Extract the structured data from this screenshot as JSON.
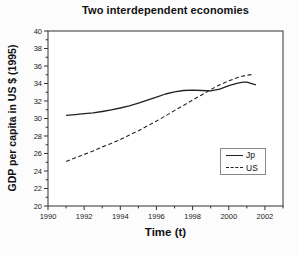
{
  "chart_data": {
    "type": "line",
    "title": "Two interdependent economies",
    "xlabel": "Time (t)",
    "ylabel": "GDP per capita in US $ (1995)",
    "xlim": [
      1990,
      2003
    ],
    "ylim": [
      20,
      40
    ],
    "xticks": [
      1990,
      1992,
      1994,
      1996,
      1998,
      2000,
      2002
    ],
    "yticks": [
      20,
      22,
      24,
      26,
      28,
      30,
      32,
      34,
      36,
      38,
      40
    ],
    "x_minor_step": 1,
    "y_minor_step": 1,
    "grid": false,
    "legend_position": "right-middle",
    "axis_color": "#333333",
    "series": [
      {
        "name": "Jp",
        "style": "solid",
        "color": "#222222",
        "points": [
          [
            1991,
            30.35
          ],
          [
            1991.5,
            30.45
          ],
          [
            1992,
            30.55
          ],
          [
            1992.5,
            30.65
          ],
          [
            1993,
            30.8
          ],
          [
            1993.5,
            31.0
          ],
          [
            1994,
            31.2
          ],
          [
            1994.5,
            31.45
          ],
          [
            1995,
            31.75
          ],
          [
            1995.5,
            32.1
          ],
          [
            1996,
            32.45
          ],
          [
            1996.5,
            32.8
          ],
          [
            1997,
            33.05
          ],
          [
            1997.5,
            33.2
          ],
          [
            1998,
            33.25
          ],
          [
            1998.5,
            33.2
          ],
          [
            1999,
            33.15
          ],
          [
            1999.5,
            33.35
          ],
          [
            2000,
            33.75
          ],
          [
            2000.5,
            34.05
          ],
          [
            2000.8,
            34.15
          ],
          [
            2001,
            34.15
          ],
          [
            2001.5,
            33.85
          ]
        ]
      },
      {
        "name": "US",
        "style": "dashed",
        "color": "#222222",
        "points": [
          [
            1991,
            25.1
          ],
          [
            1991.5,
            25.5
          ],
          [
            1992,
            25.9
          ],
          [
            1992.5,
            26.3
          ],
          [
            1993,
            26.75
          ],
          [
            1993.5,
            27.15
          ],
          [
            1994,
            27.6
          ],
          [
            1994.5,
            28.1
          ],
          [
            1995,
            28.6
          ],
          [
            1995.5,
            29.15
          ],
          [
            1996,
            29.7
          ],
          [
            1996.5,
            30.3
          ],
          [
            1997,
            30.9
          ],
          [
            1997.5,
            31.5
          ],
          [
            1998,
            32.1
          ],
          [
            1998.5,
            32.7
          ],
          [
            1999,
            33.3
          ],
          [
            1999.5,
            33.85
          ],
          [
            2000,
            34.3
          ],
          [
            2000.5,
            34.7
          ],
          [
            2001,
            34.95
          ],
          [
            2001.4,
            35.05
          ]
        ]
      }
    ]
  }
}
